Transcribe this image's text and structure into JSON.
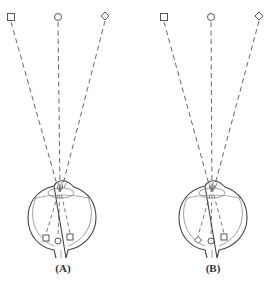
{
  "panels": [
    {
      "id": "A",
      "label": "(A)",
      "label_x": 63,
      "label_y": 262,
      "objects": [
        {
          "shape": "square",
          "x": 11,
          "y": 17
        },
        {
          "shape": "circle",
          "x": 58,
          "y": 17
        },
        {
          "shape": "diamond",
          "x": 105,
          "y": 16
        }
      ],
      "focal_point": {
        "x": 60,
        "y": 190
      },
      "eye_center": {
        "x": 62,
        "y": 220
      },
      "retinal_images": [
        {
          "shape": "square",
          "x": 46,
          "y": 238
        },
        {
          "shape": "circle",
          "x": 58,
          "y": 241
        },
        {
          "shape": "square",
          "x": 70,
          "y": 237
        }
      ]
    },
    {
      "id": "B",
      "label": "(B)",
      "label_x": 213,
      "label_y": 262,
      "objects": [
        {
          "shape": "square",
          "x": 164,
          "y": 17
        },
        {
          "shape": "circle",
          "x": 211,
          "y": 17
        },
        {
          "shape": "diamond",
          "x": 259,
          "y": 16
        }
      ],
      "focal_point": {
        "x": 212,
        "y": 190
      },
      "eye_center": {
        "x": 213,
        "y": 220
      },
      "retinal_images": [
        {
          "shape": "diamond",
          "x": 198,
          "y": 240
        },
        {
          "shape": "circle",
          "x": 211,
          "y": 241
        },
        {
          "shape": "square",
          "x": 224,
          "y": 237
        }
      ]
    }
  ],
  "colors": {
    "line": "#555555",
    "outline": "#444444",
    "inner": "#888888"
  }
}
